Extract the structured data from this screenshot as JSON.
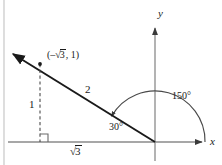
{
  "figure": {
    "kind": "trigonometry-unit-circle-reference-triangle",
    "background_color": "#ffffff",
    "line_color": "#3a3a3a",
    "ray_color": "#1a1a1a",
    "text_color": "#1a1a1a",
    "border": {
      "left_rule_visible": true,
      "color": "#b8b8b8"
    },
    "axes": {
      "x_label": "x",
      "y_label": "y",
      "origin": {
        "x": 155,
        "y": 142
      },
      "x_axis": {
        "x1": 8,
        "y1": 142,
        "x2": 205,
        "y2": 142,
        "arrow": "right"
      },
      "y_axis": {
        "x1": 155,
        "y1": 160,
        "x2": 155,
        "y2": 25,
        "arrow": "up"
      }
    },
    "terminal_ray": {
      "from": {
        "x": 155,
        "y": 142
      },
      "to": {
        "x": 10,
        "y": 52
      },
      "arrow": "upper-left",
      "length_label": "2"
    },
    "point": {
      "label_open": "(",
      "label_x_sign": "–",
      "label_x_radical": "3",
      "label_sep": ", ",
      "label_y": "1",
      "label_close": ")",
      "label_full": "(–√3, 1)",
      "at": {
        "x": 40,
        "y": 64
      }
    },
    "drop_line": {
      "style": "dashed",
      "from": {
        "x": 40,
        "y": 64
      },
      "to": {
        "x": 40,
        "y": 142
      },
      "label": "1"
    },
    "base_segment": {
      "from": {
        "x": 40,
        "y": 142
      },
      "to": {
        "x": 155,
        "y": 142
      },
      "label_radical": "3",
      "label_full": "√3"
    },
    "right_angle_marker": {
      "at": {
        "x": 40,
        "y": 142
      },
      "size": 8,
      "visible": true
    },
    "angles": [
      {
        "name": "reference-angle",
        "label": "30°",
        "value": 30,
        "unit": "degrees",
        "has_arc": false,
        "label_pos": {
          "x": 112,
          "y": 124
        }
      },
      {
        "name": "standard-position-angle",
        "label": "150°",
        "value": 150,
        "unit": "degrees",
        "has_arc": true,
        "arc_radius": 50,
        "arc_start_deg": 0,
        "arc_end_deg": 150,
        "arc_direction": "counterclockwise",
        "arrow_at_end": true,
        "label_pos": {
          "x": 175,
          "y": 94
        }
      }
    ]
  }
}
